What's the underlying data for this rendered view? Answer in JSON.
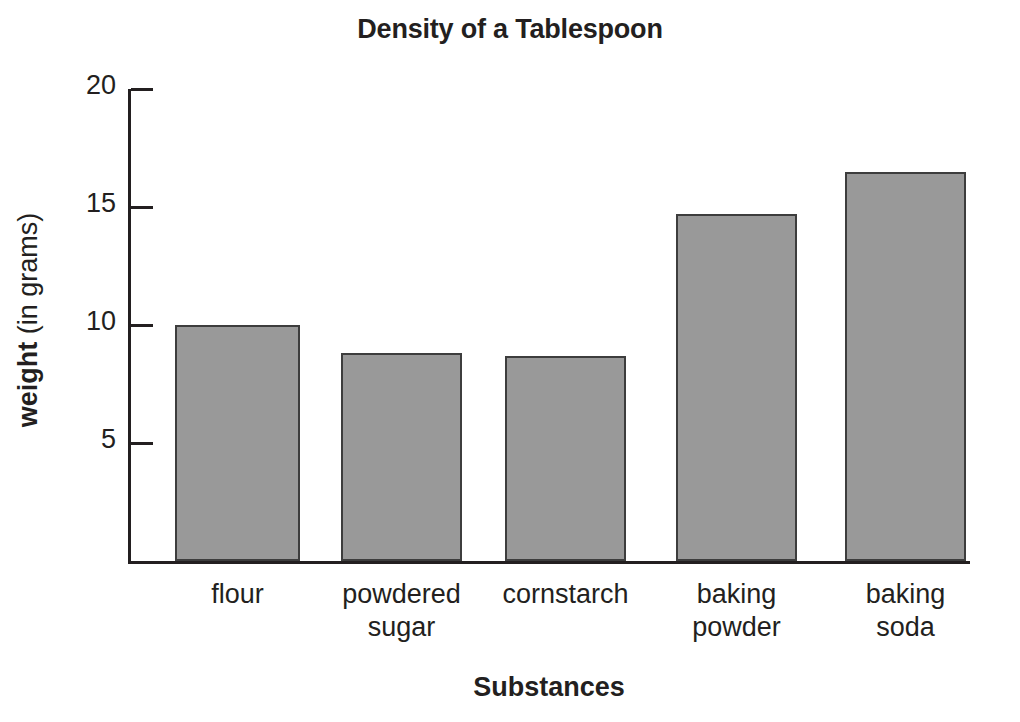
{
  "chart_data": {
    "type": "bar",
    "title": "Density of a Tablespoon",
    "xlabel": "Substances",
    "ylabel_bold": "weight",
    "ylabel_light": " (in grams)",
    "ylabel_full": "weight (in grams)",
    "categories": [
      "flour",
      "powdered sugar",
      "cornstarch",
      "baking powder",
      "baking soda"
    ],
    "category_lines": [
      [
        "flour"
      ],
      [
        "powdered",
        "sugar"
      ],
      [
        "cornstarch"
      ],
      [
        "baking",
        "powder"
      ],
      [
        "baking",
        "soda"
      ]
    ],
    "values": [
      10.0,
      8.8,
      8.7,
      14.7,
      16.5
    ],
    "ylim": [
      0,
      20
    ],
    "ytick_values": [
      5,
      10,
      15,
      20
    ],
    "ytick_labels": [
      "5",
      "10",
      "15",
      "20"
    ],
    "grid": false,
    "legend": false,
    "bar_fill_color": "#999999",
    "bar_edge_color": "#3d3d3d",
    "axis_color": "#231f20",
    "background_color": "#ffffff"
  }
}
